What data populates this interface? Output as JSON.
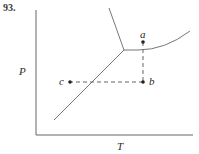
{
  "problem_number": "93.",
  "diagram": {
    "type": "phase diagram",
    "x_axis_label": "T",
    "y_axis_label": "P",
    "points": [
      {
        "label": "a",
        "x": 143,
        "y": 42
      },
      {
        "label": "b",
        "x": 143,
        "y": 82
      },
      {
        "label": "c",
        "x": 70,
        "y": 82
      }
    ],
    "paths": [
      "a to b (dashed, vertical)",
      "b to c (dashed, horizontal)"
    ],
    "colors": {
      "line": "#666666",
      "text": "#2a2a2a"
    }
  }
}
